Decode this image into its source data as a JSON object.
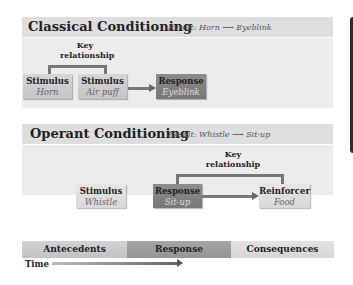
{
  "classical": {
    "title": "Classical Conditioning",
    "result": "Result: Horn ⟶ Eyeblink",
    "key_label": "Key relationship",
    "boxes": [
      {
        "label": "Stimulus",
        "value": "Horn"
      },
      {
        "label": "Stimulus",
        "value": "Air puff"
      },
      {
        "label": "Response",
        "value": "Eyeblink"
      }
    ]
  },
  "operant": {
    "title": "Operant Conditioning",
    "result": "Result: Whistle ⟶ Sit-up",
    "key_label": "Key relationship",
    "boxes": [
      {
        "label": "Stimulus",
        "value": "Whistle"
      },
      {
        "label": "Response",
        "value": "Sit-up"
      },
      {
        "label": "Reinforcer",
        "value": "Food"
      }
    ]
  },
  "timeline": {
    "cells": [
      "Antecedents",
      "Response",
      "Consequences"
    ],
    "time_label": "Time"
  },
  "colors": {
    "header_bg": "#dedede",
    "body_bg": "#ececec",
    "dark_box": "#808080",
    "light_box": "#cccccc",
    "sidebar": "#2d2d2d"
  }
}
